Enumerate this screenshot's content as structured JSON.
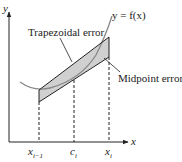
{
  "diagram": {
    "axis_y_label": "y",
    "axis_x_label": "x",
    "curve_label": "y = f(x)",
    "trapezoid_label": "Trapezoidal error",
    "midpoint_label": "Midpoint error",
    "ticks": [
      {
        "label": "x",
        "sub": "i−1"
      },
      {
        "label": "c",
        "sub": "i"
      },
      {
        "label": "x",
        "sub": "i"
      }
    ],
    "colors": {
      "fill": "#d0d0d0",
      "stroke": "#222222",
      "curve": "#888888"
    }
  }
}
